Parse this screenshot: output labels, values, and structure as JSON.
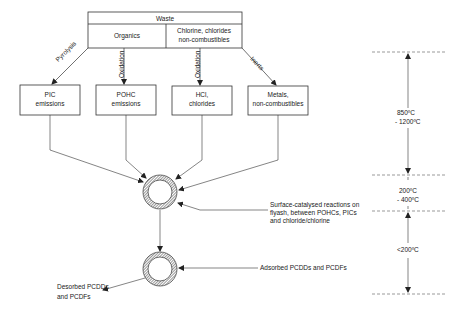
{
  "waste_box": {
    "title": "Waste",
    "left": "Organics",
    "right_line1": "Chlorine, chlorides",
    "right_line2": "non-combustibles"
  },
  "pathways": [
    {
      "label": "Pyrolysis"
    },
    {
      "label": "Oxidation"
    },
    {
      "label": "Oxidation"
    },
    {
      "label": "Inerts"
    }
  ],
  "products": [
    {
      "line1": "PIC",
      "line2": "emissions"
    },
    {
      "line1": "POHC",
      "line2": "emissions"
    },
    {
      "line1": "HCl,",
      "line2": "chlorides"
    },
    {
      "line1": "Metals,",
      "line2": "non-combustibles"
    }
  ],
  "annotations": {
    "surface_line1": "Surface-catalysed reactions on",
    "surface_line2": "flyash, between POHCs, PICs",
    "surface_line3": "and chloride/chlorine",
    "adsorbed": "Adsorbed PCDDs and PCDFs",
    "desorbed_line1": "Desorbed PCDDs",
    "desorbed_line2": "and PCDFs"
  },
  "temperature_scale": {
    "zone1_line1": "850ºC",
    "zone1_line2": "- 1200ºC",
    "zone2_line1": "200ºC",
    "zone2_line2": "- 400ºC",
    "zone3": "<200ºC"
  }
}
